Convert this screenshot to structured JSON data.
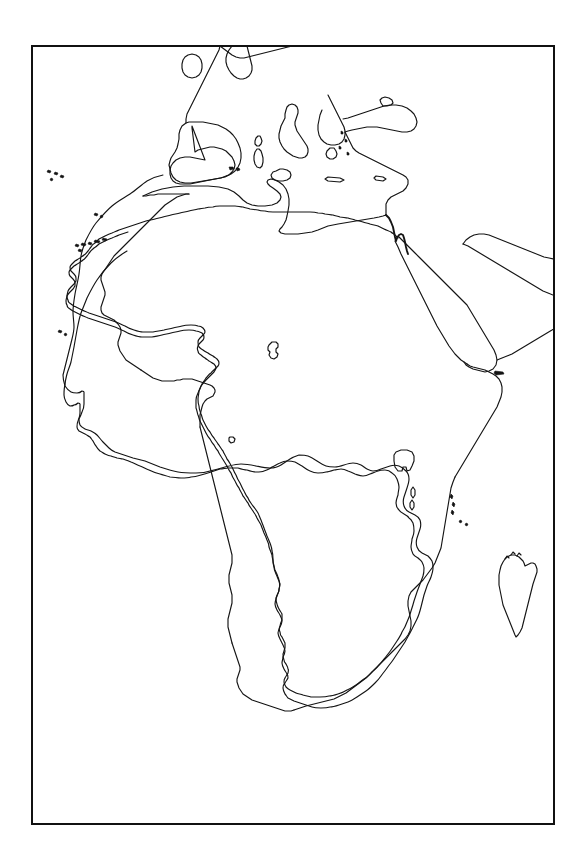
{
  "page": {
    "background_color": "#ffffff",
    "width": 587,
    "height": 865
  },
  "frame": {
    "name": "map-border",
    "color": "#111111",
    "stroke_width": 2,
    "left": 31,
    "top": 45,
    "width": 524,
    "height": 780
  },
  "map": {
    "type": "blank-outline-map",
    "subject": "Africa",
    "projection_note": "equirectangular-like",
    "line_color": "#141414",
    "fill_color": "#ffffff",
    "has_labels": false,
    "has_borders": false,
    "has_graticule": false,
    "regions_depicted": [
      "Africa",
      "Madagascar",
      "Southern Europe",
      "British Isles",
      "Iberian Peninsula",
      "Italy",
      "Sicily",
      "Sardinia",
      "Corsica",
      "Balearic Islands",
      "Crete",
      "Cyprus",
      "Greece and Aegean",
      "Black Sea",
      "Anatolia",
      "Arabian Peninsula",
      "Persian Gulf",
      "Socotra",
      "Sinai Peninsula",
      "Red Sea",
      "Canary Islands",
      "Madeira",
      "Azores",
      "Cape Verde",
      "Bioko",
      "Lake Chad",
      "Lake Victoria"
    ],
    "water_bodies": [
      "Atlantic Ocean",
      "Mediterranean Sea",
      "Red Sea",
      "Indian Ocean",
      "Gulf of Guinea",
      "Gulf of Aden",
      "Mozambique Channel",
      "Black Sea",
      "Persian Gulf"
    ]
  },
  "captions": {
    "title": "",
    "credit": "",
    "scale": ""
  }
}
